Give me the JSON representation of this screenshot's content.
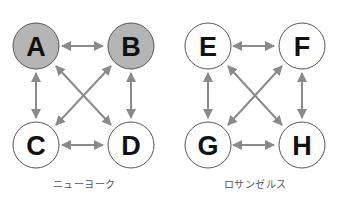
{
  "top_fragment": "",
  "diagrams": [
    {
      "caption": "ニューヨーク",
      "nodes": [
        {
          "id": "A",
          "label": "A",
          "fill": "#b5b5b5"
        },
        {
          "id": "B",
          "label": "B",
          "fill": "#b5b5b5"
        },
        {
          "id": "C",
          "label": "C",
          "fill": "#ffffff"
        },
        {
          "id": "D",
          "label": "D",
          "fill": "#ffffff"
        }
      ],
      "edges": [
        {
          "from": "A",
          "to": "B",
          "bidirectional": true
        },
        {
          "from": "A",
          "to": "C",
          "bidirectional": true
        },
        {
          "from": "A",
          "to": "D",
          "bidirectional": true
        },
        {
          "from": "B",
          "to": "C",
          "bidirectional": true
        },
        {
          "from": "B",
          "to": "D",
          "bidirectional": true
        },
        {
          "from": "C",
          "to": "D",
          "bidirectional": true
        }
      ]
    },
    {
      "caption": "ロサンゼルス",
      "nodes": [
        {
          "id": "E",
          "label": "E",
          "fill": "#ffffff"
        },
        {
          "id": "F",
          "label": "F",
          "fill": "#ffffff"
        },
        {
          "id": "G",
          "label": "G",
          "fill": "#ffffff"
        },
        {
          "id": "H",
          "label": "H",
          "fill": "#ffffff"
        }
      ],
      "edges": [
        {
          "from": "E",
          "to": "F",
          "bidirectional": true
        },
        {
          "from": "E",
          "to": "G",
          "bidirectional": true
        },
        {
          "from": "E",
          "to": "H",
          "bidirectional": true
        },
        {
          "from": "F",
          "to": "G",
          "bidirectional": true
        },
        {
          "from": "F",
          "to": "H",
          "bidirectional": true
        },
        {
          "from": "G",
          "to": "H",
          "bidirectional": true
        }
      ]
    }
  ],
  "colors": {
    "arrow": "#8a8a8a",
    "node_stroke": "#555555",
    "shaded_fill": "#b5b5b5",
    "plain_fill": "#ffffff",
    "caption": "#555555"
  }
}
